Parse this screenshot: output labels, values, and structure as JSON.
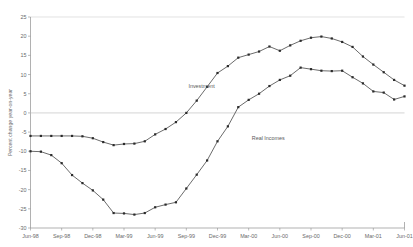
{
  "page": {
    "clipped_header_text": "",
    "background_color": "#ffffff",
    "line_color": "#3a3a3a",
    "axis_color": "#8f8f8f",
    "zero_line_color": "#c9c9c9"
  },
  "chart_data": {
    "type": "line",
    "title": "",
    "xlabel": "",
    "ylabel": "Percent change year-on-year",
    "ylim": [
      -30,
      25
    ],
    "yticks": [
      -30,
      -25,
      -20,
      -15,
      -10,
      -5,
      0,
      5,
      10,
      15,
      20,
      25
    ],
    "ytick_labels": [
      "-30",
      "-25",
      "-20",
      "-15",
      "-10",
      "-5",
      "0",
      "5",
      "10",
      "15",
      "20",
      "25"
    ],
    "grid": false,
    "zero_line": true,
    "legend": "inline-labels",
    "x": [
      "Jun-98",
      "Jul-98",
      "Aug-98",
      "Sep-98",
      "Oct-98",
      "Nov-98",
      "Dec-98",
      "Jan-99",
      "Feb-99",
      "Mar-99",
      "Apr-99",
      "May-99",
      "Jun-99",
      "Jul-99",
      "Aug-99",
      "Sep-99",
      "Oct-99",
      "Nov-99",
      "Dec-99",
      "Jan-00",
      "Feb-00",
      "Mar-00",
      "Apr-00",
      "May-00",
      "Jun-00",
      "Jul-00",
      "Aug-00",
      "Sep-00",
      "Oct-00",
      "Nov-00",
      "Dec-00",
      "Jan-01",
      "Feb-01",
      "Mar-01",
      "Apr-01",
      "May-01",
      "Jun-01"
    ],
    "xtick_labels": [
      "Jun-98",
      "Sep-98",
      "Dec-98",
      "Mar-99",
      "Jun-99",
      "Sep-99",
      "Dec-99",
      "Mar-00",
      "Jun-00",
      "Sep-00",
      "Dec-00",
      "Mar-01",
      "Jun-01"
    ],
    "xtick_indices": [
      0,
      3,
      6,
      9,
      12,
      15,
      18,
      21,
      24,
      27,
      30,
      33,
      36
    ],
    "series": [
      {
        "name": "Investment",
        "label_x_index": 15.2,
        "label_y_value": 7.0,
        "values": [
          -6.0,
          -6.0,
          -6.0,
          -6.0,
          -6.0,
          -6.1,
          -6.6,
          -7.6,
          -8.4,
          -8.1,
          -8.0,
          -7.4,
          -5.6,
          -4.2,
          -2.4,
          0.0,
          3.2,
          6.8,
          10.4,
          12.2,
          14.4,
          15.2,
          16.0,
          17.3,
          16.2,
          17.6,
          18.8,
          19.6,
          19.9,
          19.4,
          18.5,
          17.2,
          14.7,
          12.6,
          10.6,
          8.6,
          7.1
        ]
      },
      {
        "name": "Real Incomes",
        "label_x_index": 21.3,
        "label_y_value": -6.6,
        "values": [
          -10.0,
          -10.1,
          -11.0,
          -13.1,
          -16.2,
          -18.3,
          -20.2,
          -22.6,
          -26.1,
          -26.2,
          -26.5,
          -26.1,
          -24.6,
          -23.9,
          -23.3,
          -19.7,
          -16.1,
          -12.4,
          -7.4,
          -3.5,
          1.5,
          3.4,
          5.0,
          7.0,
          8.6,
          9.7,
          11.8,
          11.4,
          11.0,
          10.9,
          11.0,
          9.3,
          7.7,
          5.6,
          5.3,
          3.5,
          4.3
        ]
      }
    ]
  }
}
